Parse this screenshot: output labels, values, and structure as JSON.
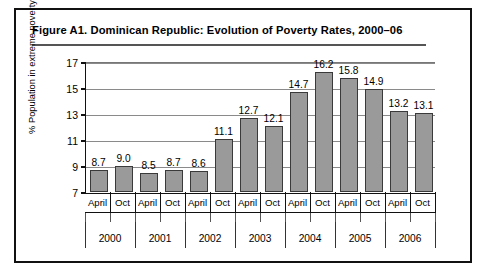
{
  "figure": {
    "title": "Figure A1.  Dominican Republic: Evolution of Poverty Rates, 2000–06"
  },
  "chart_data": {
    "type": "bar",
    "title": "Figure A1.  Dominican Republic: Evolution of Poverty Rates, 2000–06",
    "xlabel": "",
    "ylabel": "% Population in extreme poverty",
    "ylim": [
      7,
      17
    ],
    "yticks": [
      "7",
      "9",
      "11",
      "13",
      "15",
      "17"
    ],
    "grid": true,
    "legend": "none",
    "bar_color": "#9a9a9a",
    "bar_border_color": "#3a3a3a",
    "categories": [
      "April",
      "Oct",
      "April",
      "Oct",
      "April",
      "Oct",
      "April",
      "Oct",
      "April",
      "Oct",
      "April",
      "Oct",
      "April",
      "Oct"
    ],
    "values": [
      8.7,
      9.0,
      8.5,
      8.7,
      8.6,
      11.1,
      12.7,
      12.1,
      14.7,
      16.2,
      15.8,
      14.9,
      13.2,
      13.1
    ],
    "value_labels": [
      "8.7",
      "9.0",
      "8.5",
      "8.7",
      "8.6",
      "11.1",
      "12.7",
      "12.1",
      "14.7",
      "16.2",
      "15.8",
      "14.9",
      "13.2",
      "13.1"
    ],
    "groups": [
      {
        "year": "2000",
        "points": [
          {
            "period": "April",
            "value": 8.7
          },
          {
            "period": "Oct",
            "value": 9.0
          }
        ]
      },
      {
        "year": "2001",
        "points": [
          {
            "period": "April",
            "value": 8.5
          },
          {
            "period": "Oct",
            "value": 8.7
          }
        ]
      },
      {
        "year": "2002",
        "points": [
          {
            "period": "April",
            "value": 8.6
          },
          {
            "period": "Oct",
            "value": 11.1
          }
        ]
      },
      {
        "year": "2003",
        "points": [
          {
            "period": "April",
            "value": 12.7
          },
          {
            "period": "Oct",
            "value": 12.1
          }
        ]
      },
      {
        "year": "2004",
        "points": [
          {
            "period": "April",
            "value": 14.7
          },
          {
            "period": "Oct",
            "value": 16.2
          }
        ]
      },
      {
        "year": "2005",
        "points": [
          {
            "period": "April",
            "value": 15.8
          },
          {
            "period": "Oct",
            "value": 14.9
          }
        ]
      },
      {
        "year": "2006",
        "points": [
          {
            "period": "April",
            "value": 13.2
          },
          {
            "period": "Oct",
            "value": 13.1
          }
        ]
      }
    ],
    "years": [
      "2000",
      "2001",
      "2002",
      "2003",
      "2004",
      "2005",
      "2006"
    ]
  }
}
